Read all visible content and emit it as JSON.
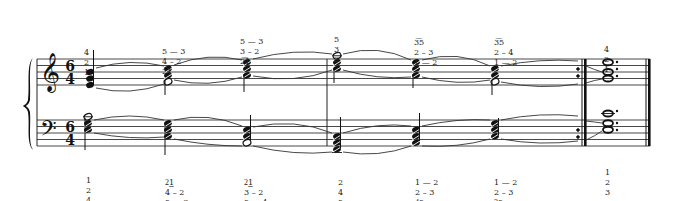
{
  "score": {
    "time_signature": {
      "numerator": "6",
      "denominator": "4"
    },
    "clefs": {
      "upper": "treble",
      "lower": "bass"
    },
    "system": {
      "brace": true,
      "final_barline": "double-thick",
      "repeat_sign": "end-repeat"
    },
    "upper_fingerings": [
      {
        "x": 112,
        "lines": [
          "4",
          "2",
          "1"
        ]
      },
      {
        "x": 161,
        "lines": [
          "5 — 3",
          "4 – 2",
          "2͡1"
        ]
      },
      {
        "x": 240,
        "lines": [
          "5 — 3",
          "3 – 2",
          "2͡1"
        ]
      },
      {
        "x": 335,
        "lines": [
          "5",
          "3",
          "2"
        ]
      },
      {
        "x": 414,
        "lines": [
          "3͡5",
          "2 – 3",
          "1 — 2"
        ]
      },
      {
        "x": 494,
        "lines": [
          "3͡5",
          "2 – 4",
          "1 — 2"
        ]
      },
      {
        "x": 604,
        "lines": [
          "4",
          "2",
          "1"
        ]
      }
    ],
    "lower_fingerings": [
      {
        "x": 87,
        "lines": [
          "1",
          "2",
          "4"
        ]
      },
      {
        "x": 166,
        "lines": [
          "2͜1",
          "4 – 2",
          "5 — 3"
        ]
      },
      {
        "x": 245,
        "lines": [
          "2͜1",
          "3 – 2",
          "5 — 4"
        ]
      },
      {
        "x": 338,
        "lines": [
          "2",
          "4",
          "5"
        ]
      },
      {
        "x": 416,
        "lines": [
          "1 — 2",
          "2 – 3",
          "4͜5"
        ]
      },
      {
        "x": 495,
        "lines": [
          "1 — 2",
          "2 – 3",
          "3͜5"
        ]
      },
      {
        "x": 605,
        "lines": [
          "1",
          "2",
          "3"
        ]
      }
    ],
    "chords": {
      "upper": [
        {
          "x": 90,
          "type": "quarter-stem-up",
          "notes": [
            "G4",
            "E4",
            "C4"
          ]
        },
        {
          "x": 168,
          "type": "tremolo",
          "notes": [
            "B4",
            "G4",
            "E4"
          ]
        },
        {
          "x": 247,
          "type": "tremolo",
          "notes": [
            "C5",
            "A4",
            "F4"
          ]
        },
        {
          "x": 337,
          "type": "tremolo",
          "notes": [
            "E5",
            "C5",
            "A4"
          ]
        },
        {
          "x": 416,
          "type": "tremolo",
          "notes": [
            "C5",
            "A4",
            "F4"
          ]
        },
        {
          "x": 495,
          "type": "tremolo",
          "notes": [
            "B4",
            "G4",
            "E4"
          ]
        },
        {
          "x": 608,
          "type": "dotted-whole",
          "notes": [
            "C5",
            "A4",
            "F4"
          ]
        }
      ],
      "lower": [
        {
          "x": 88,
          "type": "tremolo",
          "notes": [
            "A3",
            "F3",
            "D3"
          ]
        },
        {
          "x": 168,
          "type": "tremolo",
          "notes": [
            "G3",
            "E3",
            "C3"
          ]
        },
        {
          "x": 247,
          "type": "tremolo",
          "notes": [
            "E3",
            "C3",
            "A2"
          ]
        },
        {
          "x": 337,
          "type": "tremolo",
          "notes": [
            "C3",
            "A2",
            "F2"
          ]
        },
        {
          "x": 416,
          "type": "tremolo",
          "notes": [
            "E3",
            "C3",
            "A2"
          ]
        },
        {
          "x": 495,
          "type": "tremolo",
          "notes": [
            "G3",
            "E3",
            "C3"
          ]
        },
        {
          "x": 608,
          "type": "dotted-whole",
          "notes": [
            "C4",
            "A3",
            "F3"
          ]
        }
      ]
    }
  }
}
